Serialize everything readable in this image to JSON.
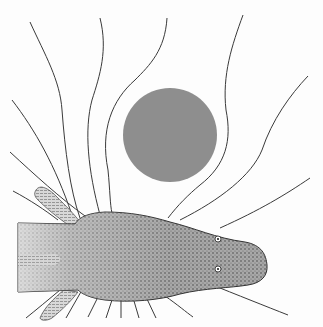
{
  "figure": {
    "colors": {
      "background": "#fdfdfd",
      "sphere": "#8e8e8e",
      "field_line": "#3a3a3a",
      "fish_body": "#9a9a9a",
      "fish_dark": "#5a5a5a"
    },
    "sphere": {
      "cx": 170,
      "cy": 135,
      "r": 47
    },
    "field_lines_count": 18
  }
}
